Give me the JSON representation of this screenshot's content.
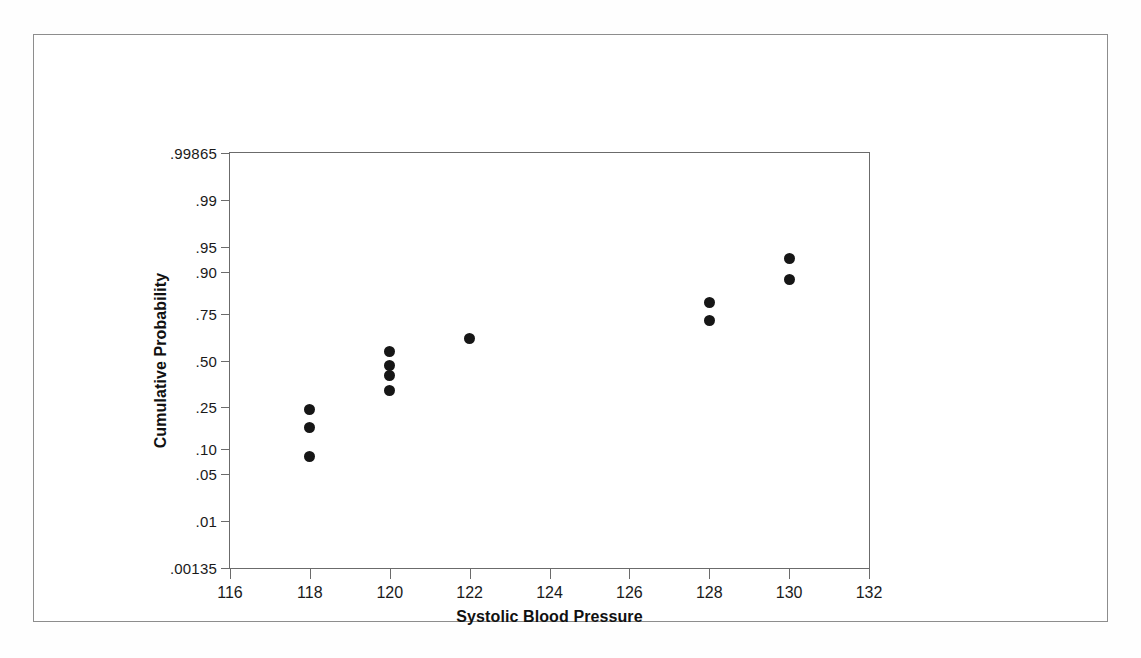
{
  "chart_data": {
    "type": "scatter",
    "title": "",
    "subtitle": "",
    "xlabel": "Systolic Blood Pressure",
    "ylabel": "Cumulative Probability",
    "grid": false,
    "legend": "none",
    "y_scale": "normal probability (probit)",
    "xlim": [
      116,
      132
    ],
    "x_ticks": [
      "116",
      "118",
      "120",
      "122",
      "124",
      "126",
      "128",
      "130",
      "132"
    ],
    "x_tick_values": [
      116,
      118,
      120,
      122,
      124,
      126,
      128,
      130,
      132
    ],
    "y_ticks": [
      ".99865",
      ".99",
      ".95",
      ".90",
      ".75",
      ".50",
      ".25",
      ".10",
      ".05",
      ".01",
      ".00135"
    ],
    "y_tick_values": [
      0.99865,
      0.99,
      0.95,
      0.9,
      0.75,
      0.5,
      0.25,
      0.1,
      0.05,
      0.01,
      0.00135
    ],
    "ylim": [
      0.00135,
      0.99865
    ],
    "series": [
      {
        "name": "Cumulative probability of systolic blood pressure",
        "marker": "filled-circle",
        "color": "#161616",
        "points": [
          {
            "x": 118,
            "y": 0.0833
          },
          {
            "x": 118,
            "y": 0.1667
          },
          {
            "x": 118,
            "y": 0.24
          },
          {
            "x": 120,
            "y": 0.3333
          },
          {
            "x": 120,
            "y": 0.4167
          },
          {
            "x": 120,
            "y": 0.47
          },
          {
            "x": 120,
            "y": 0.55
          },
          {
            "x": 122,
            "y": 0.625
          },
          {
            "x": 128,
            "y": 0.72
          },
          {
            "x": 128,
            "y": 0.8
          },
          {
            "x": 130,
            "y": 0.88
          },
          {
            "x": 130,
            "y": 0.93
          }
        ]
      }
    ]
  },
  "colors": {
    "marker": "#161616",
    "axis": "#6b6b6b",
    "page_border": "#8d8d8d",
    "text": "#111111",
    "background": "#ffffff"
  }
}
